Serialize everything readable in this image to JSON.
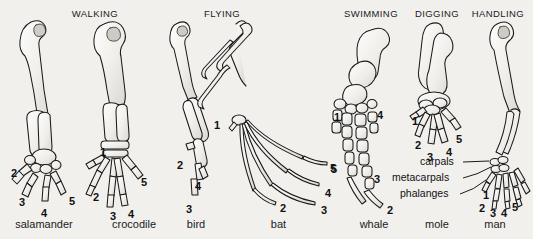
{
  "figure": {
    "title_row": [
      {
        "label": "WALKING",
        "x": 95,
        "y": 8
      },
      {
        "label": "FLYING",
        "x": 222,
        "y": 8
      },
      {
        "label": "SWIMMING",
        "x": 371,
        "y": 8
      },
      {
        "label": "DIGGING",
        "x": 437,
        "y": 8
      },
      {
        "label": "HANDLING",
        "x": 498,
        "y": 8
      }
    ],
    "species_row": [
      {
        "name": "salamander",
        "x": 44,
        "y": 224
      },
      {
        "name": "crocodile",
        "x": 134,
        "y": 224
      },
      {
        "name": "bird",
        "x": 196,
        "y": 224
      },
      {
        "name": "bat",
        "x": 278,
        "y": 224
      },
      {
        "name": "whale",
        "x": 374,
        "y": 224
      },
      {
        "name": "mole",
        "x": 437,
        "y": 224
      },
      {
        "name": "man",
        "x": 495,
        "y": 224
      }
    ],
    "digit_labels": [
      {
        "text": "2",
        "x": 11,
        "y": 168,
        "owner": "salamander"
      },
      {
        "text": "3",
        "x": 19,
        "y": 197,
        "owner": "salamander"
      },
      {
        "text": "4",
        "x": 41,
        "y": 208,
        "owner": "salamander"
      },
      {
        "text": "5",
        "x": 69,
        "y": 196,
        "owner": "salamander"
      },
      {
        "text": "1",
        "x": 100,
        "y": 147,
        "owner": "crocodile"
      },
      {
        "text": "2",
        "x": 93,
        "y": 192,
        "owner": "crocodile"
      },
      {
        "text": "3",
        "x": 110,
        "y": 211,
        "owner": "crocodile"
      },
      {
        "text": "4",
        "x": 128,
        "y": 209,
        "owner": "crocodile"
      },
      {
        "text": "5",
        "x": 141,
        "y": 177,
        "owner": "crocodile"
      },
      {
        "text": "2",
        "x": 177,
        "y": 160,
        "owner": "bird"
      },
      {
        "text": "4",
        "x": 195,
        "y": 181,
        "owner": "bird"
      },
      {
        "text": "3",
        "x": 186,
        "y": 204,
        "owner": "bird"
      },
      {
        "text": "1",
        "x": 214,
        "y": 120,
        "owner": "bat"
      },
      {
        "text": "2",
        "x": 280,
        "y": 203,
        "owner": "bat"
      },
      {
        "text": "3",
        "x": 321,
        "y": 205,
        "owner": "bat"
      },
      {
        "text": "4",
        "x": 325,
        "y": 188,
        "owner": "bat"
      },
      {
        "text": "5",
        "x": 331,
        "y": 164,
        "owner": "bat"
      },
      {
        "text": "1",
        "x": 334,
        "y": 112,
        "owner": "whale"
      },
      {
        "text": "4",
        "x": 377,
        "y": 110,
        "owner": "whale"
      },
      {
        "text": "5",
        "x": 330,
        "y": 163,
        "owner": "whale"
      },
      {
        "text": "3",
        "x": 374,
        "y": 174,
        "owner": "whale"
      },
      {
        "text": "2",
        "x": 387,
        "y": 205,
        "owner": "whale"
      },
      {
        "text": "1",
        "x": 412,
        "y": 116,
        "owner": "mole"
      },
      {
        "text": "2",
        "x": 415,
        "y": 140,
        "owner": "mole"
      },
      {
        "text": "3",
        "x": 427,
        "y": 152,
        "owner": "mole"
      },
      {
        "text": "4",
        "x": 446,
        "y": 147,
        "owner": "mole"
      },
      {
        "text": "5",
        "x": 456,
        "y": 134,
        "owner": "mole"
      },
      {
        "text": "1",
        "x": 483,
        "y": 190,
        "owner": "man"
      },
      {
        "text": "2",
        "x": 479,
        "y": 203,
        "owner": "man"
      },
      {
        "text": "3",
        "x": 490,
        "y": 208,
        "owner": "man"
      },
      {
        "text": "4",
        "x": 501,
        "y": 208,
        "owner": "man"
      },
      {
        "text": "5",
        "x": 512,
        "y": 202,
        "owner": "man"
      }
    ],
    "annotations": [
      {
        "text": "carpals",
        "x": 424,
        "y": 159
      },
      {
        "text": "metacarpals",
        "x": 404,
        "y": 175
      },
      {
        "text": "phalanges",
        "x": 412,
        "y": 191
      }
    ]
  }
}
